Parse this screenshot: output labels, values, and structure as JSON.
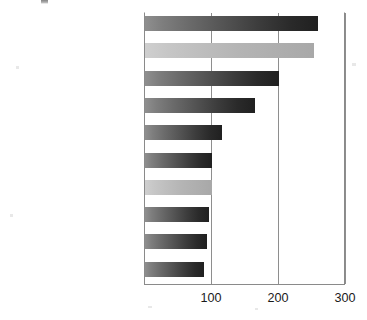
{
  "chart_data": {
    "type": "bar",
    "orientation": "horizontal",
    "title": "",
    "xlabel": "",
    "ylabel": "",
    "xlim": [
      0,
      300
    ],
    "xticks": [
      100,
      200,
      300
    ],
    "xtick_labels": [
      "100",
      "200",
      "300"
    ],
    "grid": "vertical",
    "legend": "none",
    "categories": [
      "Food Service",
      "Inpatient Health Care",
      "Food Sales",
      "Other",
      "Public Order and Safety",
      "Lodging",
      "Outpatient Health Care",
      "Public Assembly",
      "Office",
      "Education"
    ],
    "values": [
      258,
      252,
      200,
      164,
      115,
      100,
      100,
      95,
      92,
      88
    ],
    "bar_styles": [
      "dark",
      "light",
      "dark",
      "dark",
      "dark",
      "dark",
      "light",
      "dark",
      "dark",
      "dark"
    ]
  },
  "axis": {
    "ticks": [
      {
        "label": "100",
        "value": 100
      },
      {
        "label": "200",
        "value": 200
      },
      {
        "label": "300",
        "value": 300
      }
    ]
  },
  "artifact": {
    "top_glyph": ""
  }
}
